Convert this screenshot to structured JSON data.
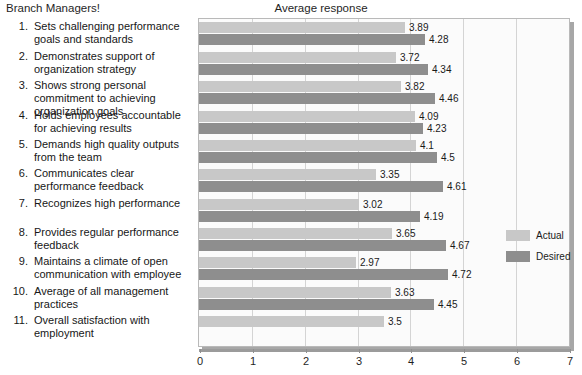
{
  "header": {
    "left_label": "Branch Managers!",
    "chart_title": "Average response"
  },
  "legend": {
    "position": "right",
    "items": [
      {
        "label": "Actual",
        "color": "#c8c8c8"
      },
      {
        "label": "Desired",
        "color": "#8e8e8e"
      }
    ]
  },
  "axis": {
    "ticks": [
      "0",
      "1",
      "2",
      "3",
      "4",
      "5",
      "6",
      "7"
    ]
  },
  "items": [
    {
      "num": "1.",
      "text": "Sets challenging performance goals and standards"
    },
    {
      "num": "2.",
      "text": "Demonstrates support of organization strategy"
    },
    {
      "num": "3.",
      "text": "Shows strong personal commitment to achieving organization goals"
    },
    {
      "num": "4.",
      "text": "Holds employees accountable for achieving results"
    },
    {
      "num": "5.",
      "text": "Demands high quality outputs from the team"
    },
    {
      "num": "6.",
      "text": "Communicates clear performance feedback"
    },
    {
      "num": "7.",
      "text": "Recognizes high performance"
    },
    {
      "num": "8.",
      "text": "Provides regular performance feedback"
    },
    {
      "num": "9.",
      "text": "Maintains a climate of open communication with employee"
    },
    {
      "num": "10.",
      "text": "Average of all management practices"
    },
    {
      "num": "11.",
      "text": "Overall satisfaction with employment"
    }
  ],
  "chart_data": {
    "type": "bar",
    "orientation": "horizontal",
    "title": "Average response",
    "xlabel": "",
    "ylabel": "",
    "xlim": [
      0,
      7
    ],
    "xticks": [
      0,
      1,
      2,
      3,
      4,
      5,
      6,
      7
    ],
    "grid": true,
    "legend_position": "right",
    "categories": [
      "1. Sets challenging performance goals and standards",
      "2. Demonstrates support of organization strategy",
      "3. Shows strong personal commitment to achieving organization goals",
      "4. Holds employees accountable for achieving results",
      "5. Demands high quality outputs from the team",
      "6. Communicates clear performance feedback",
      "7. Recognizes high performance",
      "8. Provides regular performance feedback",
      "9. Maintains a climate of open communication with employee",
      "10. Average of all management practices",
      "11. Overall satisfaction with employment"
    ],
    "series": [
      {
        "name": "Actual",
        "color": "#c8c8c8",
        "values": [
          3.89,
          3.72,
          3.82,
          4.09,
          4.1,
          3.35,
          3.02,
          3.65,
          2.97,
          3.63,
          3.5
        ],
        "labels": [
          "3.89",
          "3.72",
          "3.82",
          "4.09",
          "4.1",
          "3.35",
          "3.02",
          "3.65",
          "2.97",
          "3.63",
          "3.5"
        ]
      },
      {
        "name": "Desired",
        "color": "#8e8e8e",
        "values": [
          4.28,
          4.34,
          4.46,
          4.23,
          4.5,
          4.61,
          4.19,
          4.67,
          4.72,
          4.45,
          null
        ],
        "labels": [
          "4.28",
          "4.34",
          "4.46",
          "4.23",
          "4.5",
          "4.61",
          "4.19",
          "4.67",
          "4.72",
          "4.45",
          ""
        ]
      }
    ]
  }
}
